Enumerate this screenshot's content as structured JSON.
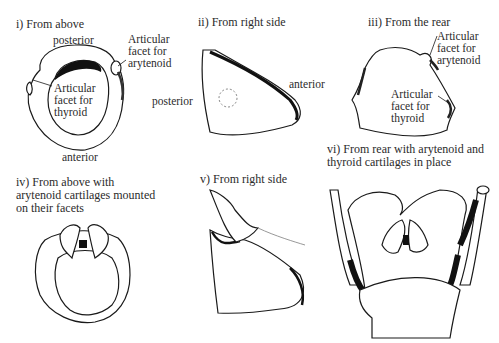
{
  "panels": [
    {
      "id": "i",
      "title": "i) From above",
      "labels": {
        "posterior": "posterior",
        "anterior": "anterior",
        "facet_arytenoid": "Articular\nfacet for\narytenoid",
        "facet_thyroid": "Articular\nfacet for\nthyroid"
      }
    },
    {
      "id": "ii",
      "title": "ii) From right side",
      "labels": {
        "posterior": "posterior",
        "anterior": "anterior"
      }
    },
    {
      "id": "iii",
      "title": "iii) From the rear",
      "labels": {
        "facet_arytenoid": "Articular\nfacet for\narytenoid",
        "facet_thyroid": "Articular\nfacet for\nthyroid"
      }
    },
    {
      "id": "iv",
      "title": "iv) From above with\narytenoid cartilages mounted\non their facets",
      "labels": {}
    },
    {
      "id": "v",
      "title": "v) From right side",
      "labels": {}
    },
    {
      "id": "vi",
      "title": "vi) From rear with arytenoid and\nthyroid cartilages in place",
      "labels": {}
    }
  ],
  "colors": {
    "ink": "#1a1a1a",
    "shade": "#111111",
    "background": "#ffffff"
  }
}
